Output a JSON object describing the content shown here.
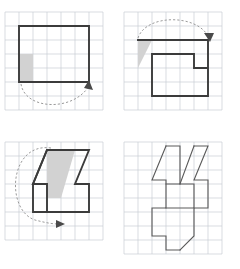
{
  "figure": {
    "title": "Four-panel shape rotation sequence on square grid paper",
    "background_color": "#ffffff",
    "grid_color": "#c9cdd4",
    "outline_color": "#3b3b3b",
    "shade_color": "#d2d2d2",
    "arc_color": "#8e8e8e",
    "cell_size": 14,
    "panel_count": 4,
    "layout": "2x2"
  },
  "panels": [
    {
      "id": "panel-tl",
      "position": "top-left",
      "label": "Panel 1 — square with one shaded unit cell and clockwise arc",
      "grid": {
        "cols": 7,
        "rows": 7,
        "origin_x": 4,
        "origin_y": 6
      },
      "shape": {
        "name": "square",
        "stroke_weight": "thick",
        "points_cells": [
          [
            1,
            1
          ],
          [
            6,
            1
          ],
          [
            6,
            5
          ],
          [
            1,
            5
          ]
        ]
      },
      "shaded_cells": [
        [
          1,
          3
        ]
      ],
      "arc": {
        "name": "rotation-arc-clockwise-below",
        "direction": "clockwise",
        "start_cell": [
          1,
          5
        ],
        "end_cell": [
          6,
          5
        ],
        "sweep": "below-shape",
        "arrow_at": "end"
      }
    },
    {
      "id": "panel-tr",
      "position": "top-right",
      "label": "Panel 2 — stepped polygon with shaded triangle and arc over the top",
      "grid": {
        "cols": 7,
        "rows": 7,
        "origin_x": 4,
        "origin_y": 6
      },
      "shape": {
        "name": "stepped-polygon",
        "stroke_weight": "thick",
        "points_cells": [
          [
            1,
            2
          ],
          [
            6,
            2
          ],
          [
            6,
            4
          ],
          [
            5,
            4
          ],
          [
            5,
            3
          ],
          [
            2,
            3
          ],
          [
            2,
            6
          ],
          [
            6,
            6
          ],
          [
            6,
            4
          ]
        ]
      },
      "shaded_cells": [],
      "shaded_triangle_cells": [
        [
          1,
          2
        ],
        [
          2,
          2
        ],
        [
          1,
          4
        ]
      ],
      "arc": {
        "name": "rotation-arc-over-top",
        "direction": "clockwise",
        "start_cell": [
          1,
          2
        ],
        "end_cell": [
          6,
          2
        ],
        "sweep": "above-shape",
        "arrow_at": "end"
      }
    },
    {
      "id": "panel-bl",
      "position": "bottom-left",
      "label": "Panel 3 — rotated polygon with shaded parallelogram and large sweeping arc",
      "grid": {
        "cols": 7,
        "rows": 7,
        "origin_x": 4,
        "origin_y": 6
      },
      "shape": {
        "name": "rotated-stepped-polygon",
        "stroke_weight": "thick"
      },
      "shaded_region": "parallelogram",
      "arc": {
        "name": "rotation-arc-large-left-sweep",
        "direction": "counterclockwise",
        "sweep": "around-left",
        "arrow_at": "end"
      }
    },
    {
      "id": "panel-br",
      "position": "bottom-right",
      "label": "Panel 4 — final combined outline shape, no shading or arc",
      "grid": {
        "cols": 7,
        "rows": 8,
        "origin_x": 4,
        "origin_y": 6
      },
      "shape": {
        "name": "final-composite-outline",
        "stroke_weight": "thin"
      },
      "shaded_region": null,
      "arc": null
    }
  ]
}
